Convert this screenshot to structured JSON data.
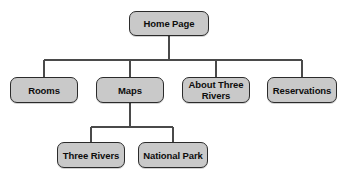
{
  "diagram": {
    "type": "site-map-tree",
    "title": "Home Page",
    "background_color": "#ffffff",
    "node_fill_color": "#c9c9c9",
    "node_border_color": "#2b2b2b",
    "connector_color": "#4a4a4a",
    "nodes": [
      {
        "id": "home-page",
        "label": "Home Page",
        "level": 0,
        "x": 129,
        "y": 11,
        "width": 80,
        "height": 25
      },
      {
        "id": "rooms",
        "label": "Rooms",
        "level": 1,
        "x": 10,
        "y": 77,
        "width": 68,
        "height": 26
      },
      {
        "id": "maps",
        "label": "Maps",
        "level": 1,
        "x": 96,
        "y": 77,
        "width": 68,
        "height": 26
      },
      {
        "id": "about-three-rivers",
        "label": "About Three\nRivers",
        "level": 1,
        "x": 182,
        "y": 77,
        "width": 68,
        "height": 26
      },
      {
        "id": "reservations",
        "label": "Reservations",
        "level": 1,
        "x": 267,
        "y": 77,
        "width": 70,
        "height": 26
      },
      {
        "id": "three-rivers",
        "label": "Three Rivers",
        "level": 2,
        "x": 57,
        "y": 142,
        "width": 68,
        "height": 26
      },
      {
        "id": "national-park",
        "label": "National Park",
        "level": 2,
        "x": 138,
        "y": 142,
        "width": 70,
        "height": 26
      }
    ],
    "edges": [
      {
        "from": "home-page",
        "to": "rooms"
      },
      {
        "from": "home-page",
        "to": "maps"
      },
      {
        "from": "home-page",
        "to": "about-three-rivers"
      },
      {
        "from": "home-page",
        "to": "reservations"
      },
      {
        "from": "maps",
        "to": "three-rivers"
      },
      {
        "from": "maps",
        "to": "national-park"
      }
    ],
    "buses": [
      {
        "id": "root-bus",
        "y": 60,
        "x1": 44,
        "x2": 302
      },
      {
        "id": "maps-bus",
        "y": 127,
        "x1": 91,
        "x2": 173
      }
    ]
  }
}
